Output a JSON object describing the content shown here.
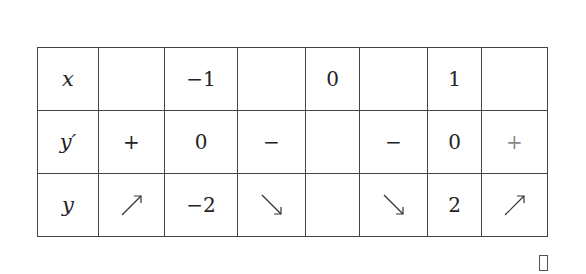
{
  "table": {
    "column_widths": [
      61,
      66,
      73,
      68,
      54,
      68,
      54,
      66
    ],
    "rows": [
      {
        "label": "x",
        "cells": [
          "",
          "−1",
          "",
          "0",
          "",
          "1",
          ""
        ]
      },
      {
        "label": "y′",
        "cells": [
          "+",
          "0",
          "−",
          "",
          "−",
          "0",
          "+"
        ]
      },
      {
        "label": "y",
        "cells": [
          "increasing-arrow",
          "−2",
          "decreasing-arrow",
          "",
          "decreasing-arrow",
          "2",
          "increasing-arrow"
        ]
      }
    ]
  },
  "icons": {
    "increasing": "north-east-arrow",
    "decreasing": "south-east-arrow"
  },
  "colors": {
    "line": "#444444",
    "text": "#222222",
    "muted_sign": "#888888"
  }
}
